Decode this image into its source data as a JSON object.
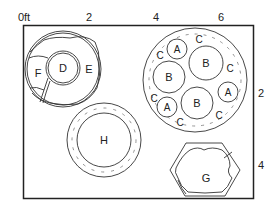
{
  "diagram": {
    "unit_label": "0ft",
    "x_ticks": [
      {
        "label": "0ft",
        "x": 24
      },
      {
        "label": "2",
        "x": 89
      },
      {
        "label": "4",
        "x": 156
      },
      {
        "label": "6",
        "x": 221
      }
    ],
    "y_ticks": [
      {
        "label": "2",
        "y": 97
      },
      {
        "label": "4",
        "y": 169
      }
    ],
    "colors": {
      "line": "#333333",
      "background": "#ffffff"
    }
  },
  "planters": {
    "def_ring": {
      "labels": {
        "d": "D",
        "e": "E",
        "f": "F"
      }
    },
    "abc_circle": {
      "a_labels": [
        "A",
        "A",
        "A"
      ],
      "b_labels": [
        "B",
        "B",
        "B"
      ],
      "c_labels": [
        "C",
        "C",
        "C",
        "C",
        "C",
        "C"
      ]
    },
    "h_ring": {
      "label": "H"
    },
    "g_hexagon": {
      "label": "G"
    }
  }
}
